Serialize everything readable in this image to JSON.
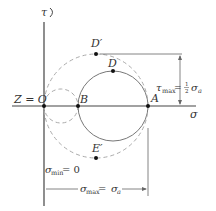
{
  "diagram": {
    "axes": {
      "vertical": "τ",
      "horizontal": "σ"
    },
    "points": {
      "origin": "Z = O",
      "B": "B",
      "A": "A",
      "D": "D",
      "D_prime": "D′",
      "E_prime": "E′"
    },
    "annotations": {
      "tau_max_prefix": "τ",
      "tau_max_sub": "max",
      "tau_max_eq": " = ",
      "tau_max_frac_num": "1",
      "tau_max_frac_den": "2",
      "tau_max_sigma": "σ",
      "tau_max_sigma_sub": "a",
      "sigma_min_prefix": "σ",
      "sigma_min_sub": "min",
      "sigma_min_eq": " = 0",
      "sigma_max_prefix": "σ",
      "sigma_max_sub": "max",
      "sigma_max_eq": " = ",
      "sigma_max_sigma": "σ",
      "sigma_max_sigma_sub": "a"
    },
    "colors": {
      "axis": "#444444",
      "circle": "#777777",
      "dashed": "#aaaaaa"
    }
  }
}
